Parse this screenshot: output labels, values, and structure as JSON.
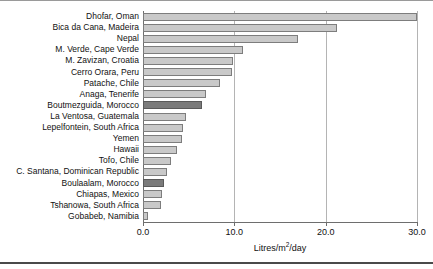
{
  "chart_data": {
    "type": "bar",
    "orientation": "horizontal",
    "title": "",
    "xlabel": "Litres/m2/day",
    "ylabel": "",
    "xlim": [
      0.0,
      30.0
    ],
    "xticks": [
      "0.0",
      "10.0",
      "20.0",
      "30.0"
    ],
    "xtick_values": [
      0.0,
      10.0,
      20.0,
      30.0
    ],
    "grid": true,
    "grid_axis": "x",
    "legend": "none",
    "categories": [
      "Dhofar, Oman",
      "Bica da Cana, Madeira",
      "Nepal",
      "M. Verde, Cape Verde",
      "M. Zavizan, Croatia",
      "Cerro Orara, Peru",
      "Patache, Chile",
      "Anaga, Tenerife",
      "Boutmezguida, Morocco",
      "La Ventosa, Guatemala",
      "Lepelfontein, South Africa",
      "Yemen",
      "Hawaii",
      "Tofo, Chile",
      "C. Santana, Dominican Republic",
      "Boulaalam, Morocco",
      "Chiapas, Mexico",
      "Tshanowa, South Africa",
      "Gobabeb, Namibia"
    ],
    "values": [
      30.0,
      21.2,
      17.0,
      10.9,
      9.8,
      9.7,
      8.4,
      6.9,
      6.5,
      4.7,
      4.4,
      4.3,
      3.7,
      3.1,
      2.6,
      2.3,
      2.1,
      2.0,
      0.6
    ],
    "highlighted": [
      "Boutmezguida, Morocco",
      "Boulaalam, Morocco"
    ],
    "colors": {
      "bar_fill": "#c9c9c9",
      "bar_edge": "#7d7d7d",
      "highlight_fill": "#7b7b7b",
      "highlight_edge": "#5a5a5a",
      "grid": "#b4b4b4",
      "axis": "#6e6e6e"
    }
  }
}
